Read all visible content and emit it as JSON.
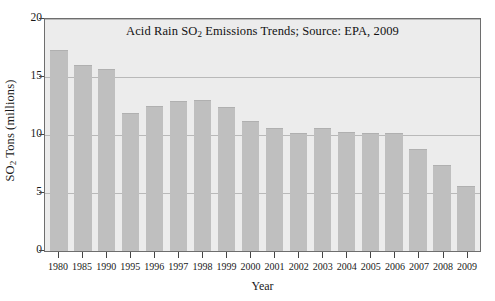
{
  "chart_data": {
    "type": "bar",
    "title": "Acid Rain SO2 Emissions Trends; Source: EPA, 2009",
    "title_parts": {
      "before": "Acid Rain SO",
      "subscript": "2",
      "after": " Emissions Trends; Source: EPA, 2009"
    },
    "xlabel": "Year",
    "ylabel": "SO2 Tons (millions)",
    "ylabel_parts": {
      "before": "SO",
      "subscript": "2",
      "after": " Tons (millions)"
    },
    "categories": [
      "1980",
      "1985",
      "1990",
      "1995",
      "1996",
      "1997",
      "1998",
      "1999",
      "2000",
      "2001",
      "2002",
      "2003",
      "2004",
      "2005",
      "2006",
      "2007",
      "2008",
      "2009"
    ],
    "values": [
      17.3,
      16.0,
      15.7,
      11.9,
      12.5,
      12.9,
      13.0,
      12.4,
      11.2,
      10.6,
      10.2,
      10.6,
      10.3,
      10.2,
      10.2,
      8.8,
      7.4,
      5.6
    ],
    "ylim": [
      0,
      20
    ],
    "yticks": [
      0,
      5,
      10,
      15,
      20
    ],
    "ytick_labels": [
      "0",
      "5",
      "10",
      "15",
      "20"
    ],
    "grid": true,
    "grid_axis": "y",
    "legend": null,
    "bar_color": "#bfbfbf",
    "plot_background": "#ececec",
    "gridline_color": "#b9b9b9",
    "axis_color": "#6e6e6e"
  }
}
